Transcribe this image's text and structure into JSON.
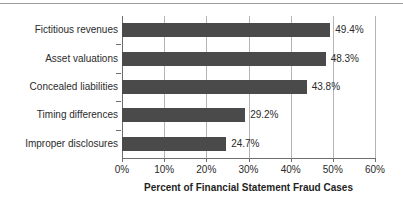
{
  "chart_data": {
    "type": "bar",
    "orientation": "horizontal",
    "title": "",
    "xlabel": "Percent of Financial Statement Fraud Cases",
    "ylabel": "",
    "xlim": [
      0,
      60
    ],
    "xticks": [
      "0%",
      "10%",
      "20%",
      "30%",
      "40%",
      "50%",
      "60%"
    ],
    "xtick_values": [
      0,
      10,
      20,
      30,
      40,
      50,
      60
    ],
    "grid": true,
    "legend": "none",
    "bar_color": "#4a4a4a",
    "categories": [
      "Fictitious revenues",
      "Asset valuations",
      "Concealed liabilities",
      "Timing differences",
      "Improper disclosures"
    ],
    "values": [
      49.4,
      48.3,
      43.8,
      29.2,
      24.7
    ],
    "data_labels": [
      "49.4%",
      "48.3%",
      "43.8%",
      "29.2%",
      "24.7%"
    ]
  }
}
